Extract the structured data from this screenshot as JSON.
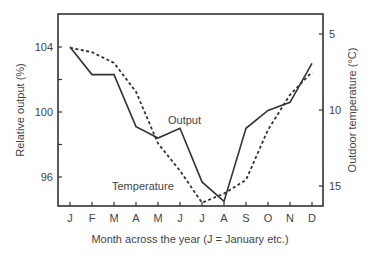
{
  "chart_data": {
    "type": "line",
    "title": "",
    "xlabel": "Month across the year (J = January etc.)",
    "ylabel": "Relative output (%)",
    "y2label": "Outdoor temperature (°C)",
    "categories": [
      "J",
      "F",
      "M",
      "A",
      "M",
      "J",
      "J",
      "A",
      "S",
      "O",
      "N",
      "D"
    ],
    "ylim": [
      94.3,
      106.1
    ],
    "y2lim": [
      16.3,
      3.7
    ],
    "y2_inverted": true,
    "yticks": [
      96,
      100,
      104
    ],
    "yticks_minor": [
      98,
      102
    ],
    "y2ticks": [
      5,
      10,
      15
    ],
    "grid": false,
    "series": [
      {
        "name": "Output",
        "axis": "left",
        "style": "solid",
        "values": [
          104.0,
          102.3,
          102.3,
          99.1,
          98.4,
          99.0,
          95.7,
          94.5,
          99.0,
          100.1,
          100.6,
          103.0
        ]
      },
      {
        "name": "Temperature",
        "axis": "right",
        "style": "dashed",
        "values": [
          5.9,
          6.2,
          6.9,
          8.8,
          12.2,
          14.0,
          16.1,
          15.5,
          14.6,
          11.3,
          9.0,
          7.5
        ]
      }
    ],
    "annotations": [
      {
        "text": "Output",
        "near": "J (June)"
      },
      {
        "text": "Temperature",
        "near": "M-J"
      }
    ]
  },
  "labels": {
    "ytick_96": "96",
    "ytick_100": "100",
    "ytick_104": "104",
    "y2tick_5": "5",
    "y2tick_10": "10",
    "y2tick_15": "15",
    "output_label": "Output",
    "temperature_label": "Temperature",
    "xlabel": "Month across the year (J = January etc.)",
    "ylabel": "Relative output (%)",
    "y2label": "Outdoor temperature (°C)"
  },
  "colors": {
    "line": "#333333",
    "text": "#444444"
  }
}
